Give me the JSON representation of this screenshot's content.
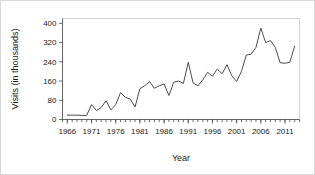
{
  "figure": {
    "background_color": "#ffffff",
    "border_color": "#d8d8d8",
    "line_color": "#4d4d4d",
    "axis_color": "#4a4a4a",
    "frame_color": "#c9c9c9"
  },
  "chart_data": {
    "type": "line",
    "title": "",
    "xlabel": "Year",
    "ylabel": "Visits (in thousands)",
    "xlim": [
      1965,
      2014
    ],
    "ylim": [
      0,
      420
    ],
    "grid": false,
    "legend": false,
    "xticklabels": [
      "1966",
      "1971",
      "1976",
      "1981",
      "1986",
      "1991",
      "1996",
      "2001",
      "2006",
      "2011"
    ],
    "xtickvalues": [
      1966,
      1971,
      1976,
      1981,
      1986,
      1991,
      1996,
      2001,
      2006,
      2011
    ],
    "yticklabels": [
      "0",
      "80",
      "160",
      "240",
      "320",
      "400"
    ],
    "ytickvalues": [
      0,
      80,
      160,
      240,
      320,
      400
    ],
    "minor_xticks_every": 1,
    "series": [
      {
        "name": "Visits",
        "x": [
          1966,
          1967,
          1968,
          1969,
          1970,
          1971,
          1972,
          1973,
          1974,
          1975,
          1976,
          1977,
          1978,
          1979,
          1980,
          1981,
          1982,
          1983,
          1984,
          1985,
          1986,
          1987,
          1988,
          1989,
          1990,
          1991,
          1992,
          1993,
          1994,
          1995,
          1996,
          1997,
          1998,
          1999,
          2000,
          2001,
          2002,
          2003,
          2004,
          2005,
          2006,
          2007,
          2008,
          2009,
          2010,
          2011,
          2012,
          2013
        ],
        "values": [
          18,
          18,
          18,
          17,
          17,
          62,
          37,
          50,
          78,
          40,
          62,
          112,
          92,
          85,
          52,
          128,
          140,
          158,
          130,
          140,
          148,
          100,
          155,
          160,
          150,
          238,
          152,
          140,
          165,
          196,
          180,
          210,
          190,
          228,
          182,
          158,
          200,
          268,
          272,
          300,
          380,
          320,
          328,
          300,
          236,
          234,
          238,
          305
        ]
      }
    ]
  }
}
